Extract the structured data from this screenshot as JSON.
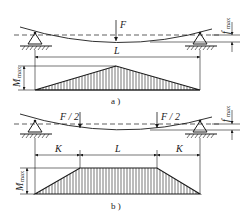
{
  "figure_a": {
    "caption": "a )",
    "load_label": "F",
    "span_label": "L",
    "deflection_label": "f",
    "deflection_sub": "max",
    "moment_label": "M",
    "moment_sub": "max"
  },
  "figure_b": {
    "caption": "b )",
    "load_left_label": "F / 2",
    "load_right_label": "F / 2",
    "span_left_label": "K",
    "span_mid_label": "L",
    "span_right_label": "K",
    "deflection_label": "f",
    "deflection_sub": "max",
    "moment_label": "M",
    "moment_sub": "max"
  },
  "colors": {
    "line": "#1a1a1a",
    "background": "#ffffff"
  }
}
